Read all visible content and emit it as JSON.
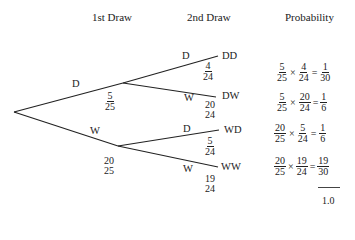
{
  "headers": {
    "first_draw": "1st Draw",
    "second_draw": "2nd Draw",
    "probability": "Probability"
  },
  "tree": {
    "root": {
      "x": 14,
      "y": 112
    },
    "first_level": [
      {
        "label": "D",
        "prob_num": "5",
        "prob_den": "25",
        "node": {
          "x": 123,
          "y": 83
        }
      },
      {
        "label": "W",
        "prob_num": "20",
        "prob_den": "25",
        "node": {
          "x": 118,
          "y": 146
        }
      }
    ],
    "second_level": [
      {
        "parent": 0,
        "label": "D",
        "outcome": "DD",
        "prob_num": "4",
        "prob_den": "24",
        "end": {
          "x": 218,
          "y": 56
        }
      },
      {
        "parent": 0,
        "label": "W",
        "outcome": "DW",
        "prob_num": "20",
        "prob_den": "24",
        "end": {
          "x": 216,
          "y": 97
        }
      },
      {
        "parent": 1,
        "label": "D",
        "outcome": "WD",
        "prob_num": "5",
        "prob_den": "24",
        "end": {
          "x": 219,
          "y": 130
        }
      },
      {
        "parent": 1,
        "label": "W",
        "outcome": "WW",
        "prob_num": "19",
        "prob_den": "24",
        "end": {
          "x": 218,
          "y": 167
        }
      }
    ]
  },
  "probabilities": [
    {
      "a_num": "5",
      "a_den": "25",
      "b_num": "4",
      "b_den": "24",
      "r_num": "1",
      "r_den": "30"
    },
    {
      "a_num": "5",
      "a_den": "25",
      "b_num": "20",
      "b_den": "24",
      "r_num": "1",
      "r_den": "6"
    },
    {
      "a_num": "20",
      "a_den": "25",
      "b_num": "5",
      "b_den": "24",
      "r_num": "1",
      "r_den": "6"
    },
    {
      "a_num": "20",
      "a_den": "25",
      "b_num": "19",
      "b_den": "24",
      "r_num": "19",
      "r_den": "30"
    }
  ],
  "operators": {
    "times": "×",
    "equals": "="
  },
  "total": "1.0",
  "colors": {
    "line": "#222222",
    "text": "#222222",
    "background": "#ffffff"
  }
}
